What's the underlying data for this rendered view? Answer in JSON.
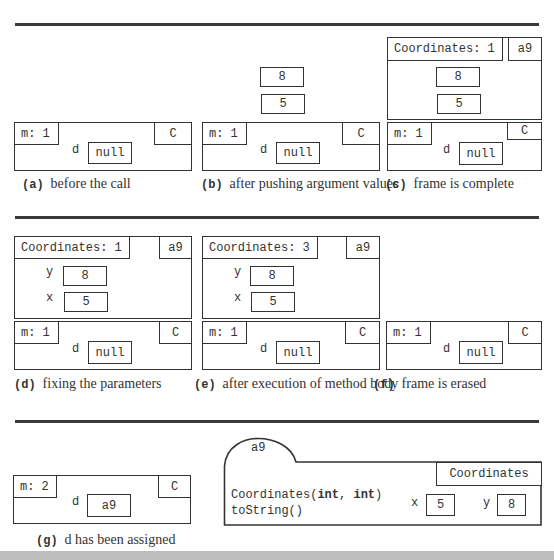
{
  "figure": {
    "rows": [
      {
        "panels": [
          {
            "id": "a",
            "caption_tag": "(a)",
            "caption_text": "before the call",
            "frame": {
              "method": "m: 1",
              "class": "C",
              "var": "d",
              "value": "null"
            }
          },
          {
            "id": "b",
            "caption_tag": "(b)",
            "caption_text": "after pushing argument values",
            "pushed_values": [
              "8",
              "5"
            ],
            "frame": {
              "method": "m: 1",
              "class": "C",
              "var": "d",
              "value": "null"
            }
          },
          {
            "id": "c",
            "caption_tag": "(c)",
            "caption_text": "frame is complete",
            "call_frame": {
              "method": "Coordinates: 1",
              "scope": "a9",
              "values": [
                "8",
                "5"
              ]
            },
            "frame": {
              "method": "m: 1",
              "class": "C",
              "var": "d",
              "value": "null"
            }
          }
        ]
      },
      {
        "panels": [
          {
            "id": "d",
            "caption_tag": "(d)",
            "caption_text": "fixing the parameters",
            "call_frame": {
              "method": "Coordinates: 1",
              "scope": "a9",
              "params": [
                {
                  "name": "y",
                  "value": "8"
                },
                {
                  "name": "x",
                  "value": "5"
                }
              ]
            },
            "frame": {
              "method": "m: 1",
              "class": "C",
              "var": "d",
              "value": "null"
            }
          },
          {
            "id": "e",
            "caption_tag": "(e)",
            "caption_text": "after execution of method body",
            "call_frame": {
              "method": "Coordinates: 3",
              "scope": "a9",
              "params": [
                {
                  "name": "y",
                  "value": "8"
                },
                {
                  "name": "x",
                  "value": "5"
                }
              ]
            },
            "frame": {
              "method": "m: 1",
              "class": "C",
              "var": "d",
              "value": "null"
            }
          },
          {
            "id": "f",
            "caption_tag": "(f)",
            "caption_text": "frame is erased",
            "frame": {
              "method": "m: 1",
              "class": "C",
              "var": "d",
              "value": "null"
            }
          }
        ]
      },
      {
        "panels": [
          {
            "id": "g",
            "caption_tag": "(g)",
            "caption_text": "d has been assigned",
            "frame": {
              "method": "m: 2",
              "class": "C",
              "var": "d",
              "value": "a9"
            },
            "object": {
              "name": "a9",
              "class": "Coordinates",
              "methods": [
                {
                  "prefix": "Coordinates(",
                  "bold1": "int",
                  "sep": ", ",
                  "bold2": "int",
                  "suffix": ")"
                },
                {
                  "text": "toString()"
                }
              ],
              "fields": [
                {
                  "name": "x",
                  "value": "5"
                },
                {
                  "name": "y",
                  "value": "8"
                }
              ]
            }
          }
        ]
      }
    ]
  },
  "colors": {
    "line": "#333333",
    "rule": "#3a3a3a",
    "background": "#ffffff"
  }
}
